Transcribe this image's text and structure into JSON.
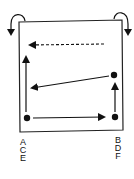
{
  "diagram": {
    "type": "movement-pattern",
    "colors": {
      "stroke": "#111111",
      "background": "#ffffff"
    },
    "left_labels": [
      "A",
      "C",
      "E"
    ],
    "right_labels": [
      "B",
      "D",
      "F"
    ],
    "nodes": [
      {
        "id": "bottom-left",
        "x": 27,
        "y": 118
      },
      {
        "id": "bottom-right",
        "x": 115,
        "y": 117
      },
      {
        "id": "mid-right",
        "x": 114,
        "y": 75
      }
    ],
    "arrows": [
      {
        "from": "bottom-left",
        "to": "bottom-right",
        "style": "solid"
      },
      {
        "from": "bottom-right",
        "to": "mid-right",
        "style": "solid"
      },
      {
        "from": "mid-right",
        "to": "left-side",
        "style": "solid"
      },
      {
        "from": "bottom-left",
        "to": "upper-left",
        "style": "solid"
      },
      {
        "from": "upper-right",
        "to": "upper-left",
        "style": "dashed"
      }
    ],
    "corner_icons": [
      "curved-down-arrow-left",
      "curved-down-arrow-right"
    ]
  }
}
